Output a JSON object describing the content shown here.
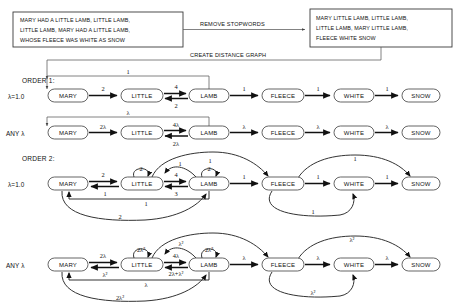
{
  "diagram": {
    "title_hidden": "",
    "source_box": {
      "name": "original-text-box",
      "lines": [
        "MARY HAD A LITTLE LAMB, LITTLE LAMB,",
        "LITTLE LAMB, MARY HAD A LITTLE LAMB,",
        "WHOSE FLEECE WAS WHITE AS SNOW"
      ]
    },
    "result_box": {
      "name": "filtered-text-box",
      "lines": [
        "MARY LITTLE LAMB, LITTLE LAMB,",
        "LITTLE LAMB, MARY LITTLE LAMB,",
        "FLEECE WHITE SNOW"
      ]
    },
    "process_labels": {
      "remove_stopwords": "REMOVE STOPWORDS",
      "create_distance_graph": "CREATE DISTANCE GRAPH"
    },
    "sections": [
      {
        "id": "order1",
        "label": "ORDER 1:"
      },
      {
        "id": "order2",
        "label": "ORDER 2:"
      }
    ],
    "row_labels": {
      "lambda_one": "λ=1.0",
      "any_lambda": "ANY λ"
    },
    "nodes": [
      "MARY",
      "LITTLE",
      "LAMB",
      "FLEECE",
      "WHITE",
      "SNOW"
    ],
    "graphs": [
      {
        "id": "order1-lambda1",
        "section": "ORDER 1:",
        "row_label": "λ=1.0",
        "edges": [
          {
            "from": "MARY",
            "to": "LITTLE",
            "weight": "2",
            "shape": "straight"
          },
          {
            "from": "LITTLE",
            "to": "LAMB",
            "weight": "4",
            "shape": "straight-upper"
          },
          {
            "from": "LAMB",
            "to": "LITTLE",
            "weight": "2",
            "shape": "straight-lower"
          },
          {
            "from": "LAMB",
            "to": "MARY",
            "weight": "1",
            "shape": "top-bracket"
          },
          {
            "from": "LAMB",
            "to": "FLEECE",
            "weight": "1",
            "shape": "straight"
          },
          {
            "from": "FLEECE",
            "to": "WHITE",
            "weight": "1",
            "shape": "straight"
          },
          {
            "from": "WHITE",
            "to": "SNOW",
            "weight": "1",
            "shape": "straight"
          }
        ]
      },
      {
        "id": "order1-anylambda",
        "section": "ORDER 1:",
        "row_label": "ANY λ",
        "edges": [
          {
            "from": "MARY",
            "to": "LITTLE",
            "weight": "2λ",
            "shape": "straight"
          },
          {
            "from": "LITTLE",
            "to": "LAMB",
            "weight": "4λ",
            "shape": "straight-upper"
          },
          {
            "from": "LAMB",
            "to": "LITTLE",
            "weight": "2λ",
            "shape": "straight-lower"
          },
          {
            "from": "LAMB",
            "to": "MARY",
            "weight": "λ",
            "shape": "top-bracket"
          },
          {
            "from": "LAMB",
            "to": "FLEECE",
            "weight": "λ",
            "shape": "straight"
          },
          {
            "from": "FLEECE",
            "to": "WHITE",
            "weight": "λ",
            "shape": "straight"
          },
          {
            "from": "WHITE",
            "to": "SNOW",
            "weight": "λ",
            "shape": "straight"
          }
        ]
      },
      {
        "id": "order2-lambda1",
        "section": "ORDER 2:",
        "row_label": "λ=1.0",
        "edges": [
          {
            "from": "MARY",
            "to": "LITTLE",
            "weight": "2",
            "shape": "straight-upper"
          },
          {
            "from": "LITTLE",
            "to": "MARY",
            "weight": "1",
            "shape": "straight-lower"
          },
          {
            "from": "LITTLE",
            "to": "LITTLE",
            "weight": "2",
            "shape": "self-loop"
          },
          {
            "from": "LITTLE",
            "to": "LAMB",
            "weight": "4",
            "shape": "straight-upper"
          },
          {
            "from": "LAMB",
            "to": "LITTLE",
            "weight": "3",
            "shape": "straight-lower"
          },
          {
            "from": "LAMB",
            "to": "LAMB",
            "weight": "2",
            "shape": "self-loop"
          },
          {
            "from": "LAMB",
            "to": "LITTLE",
            "weight": "1",
            "shape": "arc-above"
          },
          {
            "from": "LAMB",
            "to": "MARY",
            "weight": "1",
            "shape": "bracket-below"
          },
          {
            "from": "MARY",
            "to": "LAMB",
            "weight": "2",
            "shape": "arc-below"
          },
          {
            "from": "LITTLE",
            "to": "FLEECE",
            "weight": "1",
            "shape": "arc-above-long"
          },
          {
            "from": "LAMB",
            "to": "FLEECE",
            "weight": "1",
            "shape": "straight"
          },
          {
            "from": "FLEECE",
            "to": "LAMB",
            "weight": "1",
            "shape": "arc-below-long"
          },
          {
            "from": "FLEECE",
            "to": "WHITE",
            "weight": "1",
            "shape": "straight"
          },
          {
            "from": "FLEECE",
            "to": "SNOW",
            "weight": "1",
            "shape": "arc-above-long"
          },
          {
            "from": "WHITE",
            "to": "SNOW",
            "weight": "1",
            "shape": "straight"
          }
        ]
      },
      {
        "id": "order2-anylambda",
        "section": "ORDER 2:",
        "row_label": "ANY λ",
        "edges": [
          {
            "from": "MARY",
            "to": "LITTLE",
            "weight": "2λ",
            "shape": "straight-upper"
          },
          {
            "from": "LITTLE",
            "to": "MARY",
            "weight": "λ²",
            "shape": "straight-lower"
          },
          {
            "from": "LITTLE",
            "to": "LITTLE",
            "weight": "2λ²",
            "shape": "self-loop"
          },
          {
            "from": "LITTLE",
            "to": "LAMB",
            "weight": "4λ",
            "shape": "straight-upper"
          },
          {
            "from": "LAMB",
            "to": "LITTLE",
            "weight": "2λ+λ²",
            "shape": "straight-lower"
          },
          {
            "from": "LAMB",
            "to": "LAMB",
            "weight": "2λ²",
            "shape": "self-loop"
          },
          {
            "from": "LAMB",
            "to": "LITTLE",
            "weight": "λ²",
            "shape": "arc-above"
          },
          {
            "from": "LAMB",
            "to": "MARY",
            "weight": "λ",
            "shape": "bracket-below"
          },
          {
            "from": "MARY",
            "to": "LAMB",
            "weight": "2λ²",
            "shape": "arc-below"
          },
          {
            "from": "LITTLE",
            "to": "FLEECE",
            "weight": "",
            "shape": "arc-above-long"
          },
          {
            "from": "LAMB",
            "to": "FLEECE",
            "weight": "λ",
            "shape": "straight"
          },
          {
            "from": "FLEECE",
            "to": "LAMB",
            "weight": "λ²",
            "shape": "arc-below-long"
          },
          {
            "from": "FLEECE",
            "to": "WHITE",
            "weight": "λ",
            "shape": "straight"
          },
          {
            "from": "FLEECE",
            "to": "SNOW",
            "weight": "λ²",
            "shape": "arc-above-long"
          },
          {
            "from": "WHITE",
            "to": "SNOW",
            "weight": "λ",
            "shape": "straight"
          }
        ]
      }
    ],
    "colors": {
      "stroke": "#1c1c1c",
      "light_stroke": "#5a5a5a",
      "box_border": "#3a3a3a",
      "background": "#ffffff"
    }
  }
}
